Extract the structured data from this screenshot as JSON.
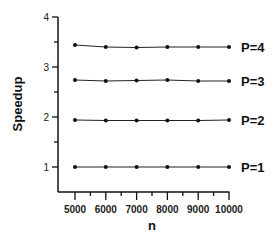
{
  "chart_data": {
    "type": "line",
    "title": "",
    "xlabel": "n",
    "ylabel": "Speedup",
    "x": [
      5000,
      6000,
      7000,
      8000,
      9000,
      10000
    ],
    "xticks": [
      "5000",
      "6000",
      "7000",
      "8000",
      "9000",
      "10000"
    ],
    "yticks": [
      "1",
      "2",
      "3",
      "4"
    ],
    "ylim": [
      0.5,
      4
    ],
    "xlim": [
      4500,
      10000
    ],
    "grid": false,
    "legend_position": "inline-right",
    "series": [
      {
        "name": "P=1",
        "values": [
          1.0,
          1.0,
          1.0,
          1.0,
          1.0,
          1.0
        ]
      },
      {
        "name": "P=2",
        "values": [
          1.94,
          1.93,
          1.93,
          1.93,
          1.93,
          1.94
        ]
      },
      {
        "name": "P=3",
        "values": [
          2.74,
          2.72,
          2.73,
          2.74,
          2.72,
          2.72
        ]
      },
      {
        "name": "P=4",
        "values": [
          3.44,
          3.4,
          3.39,
          3.4,
          3.4,
          3.4
        ]
      }
    ]
  }
}
